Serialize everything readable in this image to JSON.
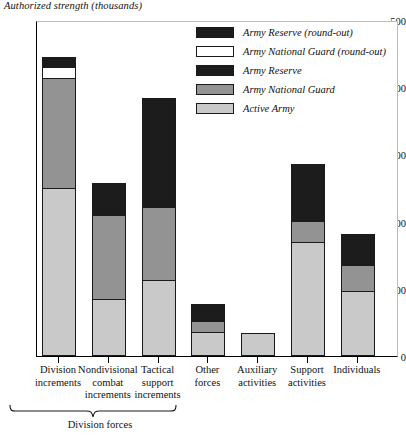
{
  "chart_data": {
    "type": "bar",
    "title": "Authorized strength (thousands)",
    "xlabel": "",
    "ylabel": "Authorized strength (thousands)",
    "ylim": [
      0,
      500
    ],
    "yticks": [
      0,
      100,
      200,
      300,
      400,
      500
    ],
    "grid": false,
    "stacked": true,
    "legend_position": "top-right",
    "categories": [
      "Division increments",
      "Nondivisional combat increments",
      "Tactical support increments",
      "Other forces",
      "Auxiliary activities",
      "Support activities",
      "Individuals"
    ],
    "series": [
      {
        "name": "Active Army",
        "color": "#c9c9c9",
        "values": [
          250,
          85,
          113,
          36,
          34,
          170,
          97
        ]
      },
      {
        "name": "Army National Guard",
        "color": "#939393",
        "values": [
          164,
          125,
          109,
          16,
          0,
          31,
          38
        ]
      },
      {
        "name": "Army Reserve",
        "color": "#1c1c1c",
        "values": [
          0,
          48,
          162,
          26,
          0,
          85,
          46
        ]
      },
      {
        "name": "Army National Guard (round-out)",
        "color": "#ffffff",
        "values": [
          16,
          0,
          0,
          0,
          0,
          0,
          0
        ]
      },
      {
        "name": "Army Reserve (round-out)",
        "color": "#1c1c1c",
        "values": [
          15,
          0,
          0,
          0,
          0,
          0,
          0
        ]
      }
    ],
    "totals": [
      445,
      258,
      384,
      78,
      34,
      286,
      181
    ],
    "annotations": [
      {
        "text": "Division forces",
        "covers": [
          "Division increments",
          "Nondivisional combat increments",
          "Tactical support increments"
        ]
      }
    ]
  },
  "legend": {
    "items": [
      {
        "label": "Army Reserve (round-out)",
        "color": "#1c1c1c"
      },
      {
        "label": "Army National Guard (round-out)",
        "color": "#ffffff"
      },
      {
        "label": "Army Reserve",
        "color": "#1c1c1c"
      },
      {
        "label": "Army National Guard",
        "color": "#939393"
      },
      {
        "label": "Active Army",
        "color": "#c9c9c9"
      }
    ]
  },
  "xaxis": {
    "categories": [
      {
        "lines": [
          "Division",
          "increments"
        ]
      },
      {
        "lines": [
          "Nondivisional",
          "combat",
          "increments"
        ]
      },
      {
        "lines": [
          "Tactical",
          "support",
          "increments"
        ]
      },
      {
        "lines": [
          "Other",
          "forces"
        ]
      },
      {
        "lines": [
          "Auxiliary",
          "activities"
        ]
      },
      {
        "lines": [
          "Support",
          "activities"
        ]
      },
      {
        "lines": [
          "Individuals"
        ]
      }
    ],
    "group_label": "Division forces"
  },
  "yaxis": {
    "ticks": [
      "500",
      "400",
      "300",
      "200",
      "100",
      "0"
    ]
  }
}
